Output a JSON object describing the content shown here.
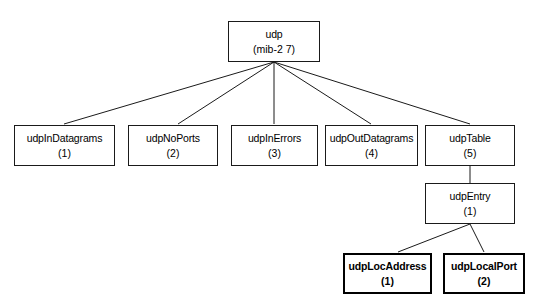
{
  "diagram": {
    "type": "tree",
    "canvas": {
      "width": 541,
      "height": 305
    },
    "style": {
      "background_color": "#ffffff",
      "line_color": "#1a1a1a",
      "box_border_color": "#1a1a1a",
      "box_fill_color": "#ffffff",
      "text_color": "#000000"
    },
    "nodes": [
      {
        "id": "udp",
        "label": "udp",
        "index": "(mib-2 7)",
        "bold": false,
        "x": 228,
        "y": 21,
        "w": 92,
        "h": 41
      },
      {
        "id": "udpInDatagrams",
        "label": "udpInDatagrams",
        "index": "(1)",
        "bold": false,
        "x": 14,
        "y": 125,
        "w": 101,
        "h": 41
      },
      {
        "id": "udpNoPorts",
        "label": "udpNoPorts",
        "index": "(2)",
        "bold": false,
        "x": 128,
        "y": 125,
        "w": 90,
        "h": 41
      },
      {
        "id": "udpInErrors",
        "label": "udpInErrors",
        "index": "(3)",
        "bold": false,
        "x": 231,
        "y": 125,
        "w": 87,
        "h": 41
      },
      {
        "id": "udpOutDatagrams",
        "label": "udpOutDatagrams",
        "index": "(4)",
        "bold": false,
        "x": 325,
        "y": 125,
        "w": 93,
        "h": 41
      },
      {
        "id": "udpTable",
        "label": "udpTable",
        "index": "(5)",
        "bold": false,
        "x": 425,
        "y": 125,
        "w": 90,
        "h": 41
      },
      {
        "id": "udpEntry",
        "label": "udpEntry",
        "index": "(1)",
        "bold": false,
        "x": 425,
        "y": 183,
        "w": 90,
        "h": 41
      },
      {
        "id": "udpLocAddress",
        "label": "udpLocAddress",
        "index": "(1)",
        "bold": true,
        "x": 343,
        "y": 253,
        "w": 89,
        "h": 41
      },
      {
        "id": "udpLocalPort",
        "label": "udpLocalPort",
        "index": "(2)",
        "bold": true,
        "x": 443,
        "y": 253,
        "w": 82,
        "h": 41
      }
    ],
    "edges": [
      {
        "from": "udp",
        "to": "udpInDatagrams",
        "x1": 274,
        "y1": 62,
        "x2": 64,
        "y2": 124
      },
      {
        "from": "udp",
        "to": "udpNoPorts",
        "x1": 274,
        "y1": 62,
        "x2": 178,
        "y2": 124
      },
      {
        "from": "udp",
        "to": "udpInErrors",
        "x1": 274,
        "y1": 62,
        "x2": 274,
        "y2": 124
      },
      {
        "from": "udp",
        "to": "udpOutDatagrams",
        "x1": 274,
        "y1": 62,
        "x2": 371,
        "y2": 124
      },
      {
        "from": "udp",
        "to": "udpTable",
        "x1": 274,
        "y1": 62,
        "x2": 470,
        "y2": 124
      },
      {
        "from": "udpTable",
        "to": "udpEntry",
        "x1": 470,
        "y1": 166,
        "x2": 470,
        "y2": 183
      },
      {
        "from": "udpEntry",
        "to": "udpLocAddress",
        "x1": 470,
        "y1": 224,
        "x2": 398,
        "y2": 252
      },
      {
        "from": "udpEntry",
        "to": "udpLocalPort",
        "x1": 470,
        "y1": 224,
        "x2": 484,
        "y2": 252
      }
    ]
  }
}
